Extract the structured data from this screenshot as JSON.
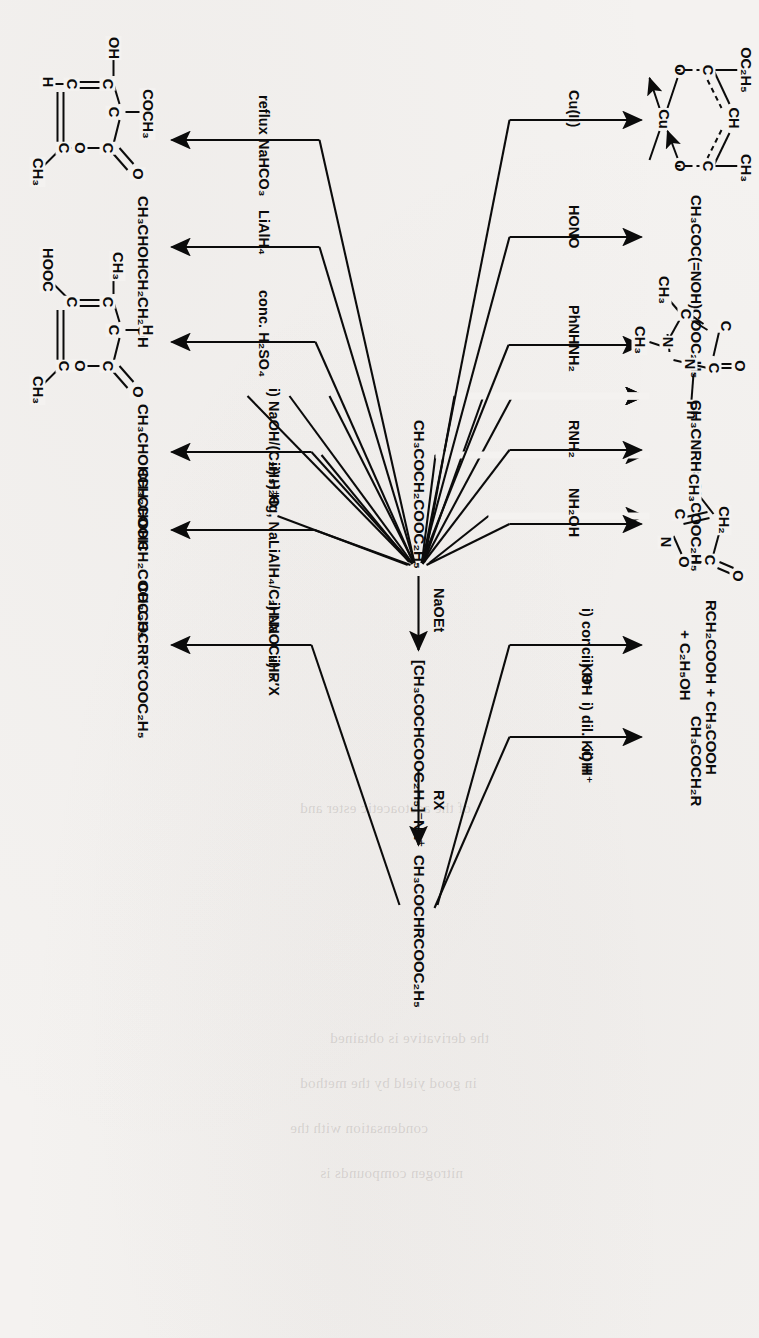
{
  "figure": {
    "type": "reaction-scheme",
    "orientation": "rotated 90 degrees clockwise on the page",
    "background_color": "#f4f2f0",
    "ink_color": "#0b0b0b"
  },
  "backbone": {
    "start_label": "CH₃COCH₂COOC₂H₅",
    "steps": [
      {
        "reagent": "NaOEt",
        "product": "[CH₃COCHCOOC₂H₅]⁻Na⁺"
      },
      {
        "reagent": "RX",
        "product": "CH₃COCHRCOOC₂H₅"
      }
    ]
  },
  "branches_upper": [
    {
      "id": "cu-chelate",
      "reagent": "Cu(II)",
      "product_kind": "structure",
      "product_name": "copper(II) bis(ethyl acetoacetate) chelate",
      "atoms": [
        "OC₂H₅",
        "CH",
        "CH₃",
        "C",
        "C",
        "O",
        "O",
        "Cu",
        "O",
        "O",
        "C",
        "C",
        "HC",
        "CH₃",
        "C₂H₅O"
      ]
    },
    {
      "id": "oximino",
      "reagent": "HONO",
      "product_kind": "formula",
      "product": "CH₃COC(=NOH)COOC₂H₅"
    },
    {
      "id": "antipyrine",
      "reagent": "PhNHNH₂",
      "product_kind": "structure",
      "product_name": "antipyrine (1-phenyl-2,3-dimethylpyrazol-5-one)",
      "atoms": [
        "O",
        "C",
        "C",
        "C",
        "N",
        "N",
        "Ph",
        "CH₃",
        "CH₃"
      ]
    },
    {
      "id": "enamine",
      "reagent": "RNH₂",
      "product_kind": "formula",
      "product": "CH₃CNRH=CHCOOC₂H₅"
    },
    {
      "id": "isoxazolone",
      "reagent": "NH₂OH",
      "product_kind": "structure",
      "product_name": "3-methylisoxazol-5(4H)-one",
      "atoms": [
        "CH₂",
        "O",
        "C",
        "C",
        "O",
        "N",
        "CH₃"
      ]
    },
    {
      "id": "acid-cleavage",
      "reagent_lines": [
        "i) conc. KOH",
        "ii) H⁺"
      ],
      "product_kind": "formula",
      "product_lines": [
        "RCH₂COOH + CH₃COOH",
        "+ C₂H₅OH"
      ]
    },
    {
      "id": "ketone-cleavage",
      "reagent_lines": [
        "i) dil. KOH",
        "ii) H⁺"
      ],
      "product_kind": "formula",
      "product": "CH₃COCH₂R"
    }
  ],
  "branches_lower": [
    {
      "id": "dehydroacetic-acid",
      "reagent": "reflux NaHCO₃",
      "product_kind": "structure",
      "product_name": "dehydroacetic acid",
      "atoms": [
        "COCH₃",
        "OH",
        "H",
        "C",
        "C",
        "C",
        "C",
        "C",
        "O",
        "O",
        "CH₃"
      ]
    },
    {
      "id": "butane-1-3-diol",
      "reagent": "LiAlH₄",
      "product_kind": "formula",
      "product": "CH₃CHOHCH₂CH₂OH"
    },
    {
      "id": "isodehydroacetic-acid",
      "reagent": "conc. H₂SO₄",
      "product_kind": "structure",
      "product_name": "isodehydroacetic acid",
      "atoms": [
        "CH₃",
        "H",
        "HOOC",
        "C",
        "C",
        "C",
        "C",
        "C",
        "O",
        "O",
        "CH₃"
      ]
    },
    {
      "id": "hydroxy-acid",
      "reagent_lines": [
        "i) NaOH/(C₂H₅)₂O",
        "ii) H⁺"
      ],
      "product_kind": "formula",
      "product": "CH₃CHOHCH₂COOH"
    },
    {
      "id": "hydroxy-ester",
      "reagent_lines": [
        "Hg, Na",
        "LiAlH₄/C₂H₅N"
      ],
      "product_kind": "formula",
      "product": "CH₃CHOHCH₂COOC₂H₅"
    },
    {
      "id": "dialkylated-ester",
      "reagent_lines": [
        "i) NaOC₂H₅",
        "ii) R′X"
      ],
      "product_kind": "formula",
      "product": "CH₃COCRR′COOC₂H₅"
    }
  ],
  "ghost_text": [
    "of the acetoacetic ester and",
    "the derivative is obtained",
    "in good yield by the method",
    "condensation with the",
    "nitrogen compounds is"
  ]
}
